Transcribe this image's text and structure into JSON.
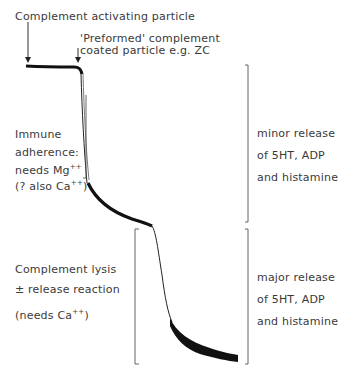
{
  "title_labels": {
    "complement_activating": "Complement activating particle",
    "preformed_line1": "'Preformed' complement",
    "preformed_line2": "coated particle  e.g. ZC"
  },
  "left_annotations": {
    "immune_adherence": {
      "line1": "Immune",
      "line2": "adherence:",
      "line3_text": "needs Mg",
      "line3_sup": "++",
      "line4_text": "(? also Ca",
      "line4_sup": "++",
      "line4_end": ")"
    },
    "complement_lysis": {
      "line1": "Complement lysis",
      "line2": "± release reaction",
      "line3_text": "(needs Ca",
      "line3_sup": "++",
      "line3_end": ")"
    }
  },
  "right_annotations": {
    "minor": {
      "line1": "minor release",
      "line2": "of 5HT, ADP",
      "line3": "and histamine"
    },
    "major": {
      "line1": "major release",
      "line2": "of 5HT, ADP",
      "line3": "and histamine"
    }
  },
  "colors": {
    "trace": "#111111",
    "text": "#3a3a3a",
    "bracket": "#555555"
  }
}
